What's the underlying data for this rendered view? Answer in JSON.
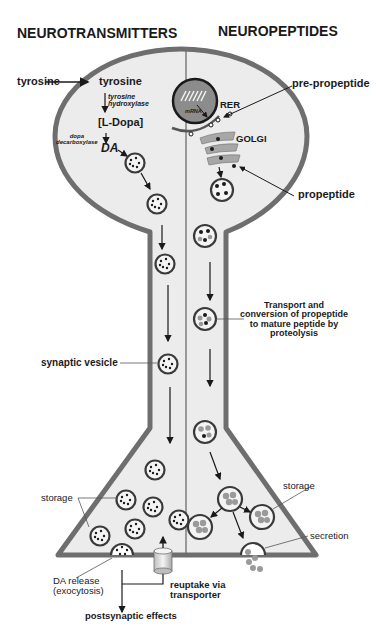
{
  "headers": {
    "left": "NEUROTRANSMITTERS",
    "right": "NEUROPEPTIDES"
  },
  "neurotransmitter_pathway": {
    "precursor_outside": "tyrosine",
    "precursor_inside": "tyrosine",
    "enzyme_1": "tyrosine hydroxylase",
    "enzyme_1_line1": "tyrosine",
    "enzyme_1_line2": "hydroxylase",
    "intermediate": "[L-Dopa]",
    "enzyme_2_line1": "dopa",
    "enzyme_2_line2": "decarboxylase",
    "product": "DA"
  },
  "neuropeptide_pathway": {
    "mrna": "mRNA",
    "rer": "RER",
    "golgi": "GOLGI",
    "pre_propeptide": "pre-propeptide",
    "propeptide": "propeptide",
    "transport_note_line1": "Transport and",
    "transport_note_line2": "conversion of propeptide",
    "transport_note_line3": "to mature peptide by",
    "transport_note_line4": "proteolysis"
  },
  "terminal": {
    "synaptic_vesicle": "synaptic vesicle",
    "storage_left": "storage",
    "storage_right": "storage",
    "secretion": "secretion",
    "da_release_line1": "DA release",
    "da_release_line2": "(exocytosis)",
    "reuptake_line1": "reuptake via",
    "reuptake_line2": "transporter",
    "postsynaptic": "postsynaptic effects"
  },
  "colors": {
    "membrane": "#6e6e6e",
    "cytoplasm": "#ececec",
    "nucleus": "#8c8c8c",
    "dark": "#1a1a1a",
    "peptide_gray": "#9a9a9a"
  }
}
